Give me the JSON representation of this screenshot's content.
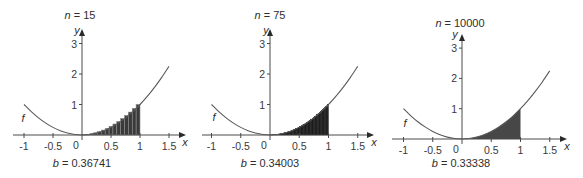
{
  "chart_data": [
    {
      "type": "line",
      "title": {
        "var": "n",
        "equals": "=",
        "value": "15"
      },
      "n": 15,
      "rule": "right endpoint rectangles",
      "shading": "rectangles",
      "shade_interval": [
        0,
        1
      ],
      "fill_color": "#3a3a3a",
      "edge_color": "#8c8c8c",
      "caption": {
        "var": "b",
        "equals": "=",
        "value": "0.36741"
      },
      "xlabel": "x",
      "ylabel": "y",
      "curve_label": "f",
      "xlim": [
        -1,
        1.5
      ],
      "ylim": [
        0,
        3
      ],
      "grid": false,
      "xticks": [
        -1,
        -0.5,
        0.5,
        1,
        1.5
      ],
      "xtick_labels": [
        "-1",
        "-0.5",
        "0.5",
        "1",
        "1.5"
      ],
      "origin_label": "0",
      "yticks": [
        1,
        2,
        3
      ],
      "ytick_labels": [
        "1",
        "2",
        "3"
      ],
      "rectangle_heights": [
        0.00444,
        0.01778,
        0.04,
        0.07111,
        0.11111,
        0.16,
        0.21778,
        0.28444,
        0.36,
        0.44444,
        0.53778,
        0.64,
        0.75111,
        0.87111,
        1.0
      ],
      "series": [
        {
          "name": "f",
          "x": [
            -1,
            -0.875,
            -0.75,
            -0.625,
            -0.5,
            -0.375,
            -0.25,
            -0.125,
            0,
            0.125,
            0.25,
            0.375,
            0.5,
            0.625,
            0.75,
            0.875,
            1,
            1.125,
            1.25,
            1.375,
            1.5
          ],
          "y": [
            1,
            0.765625,
            0.5625,
            0.390625,
            0.25,
            0.140625,
            0.0625,
            0.015625,
            0,
            0.015625,
            0.0625,
            0.140625,
            0.25,
            0.390625,
            0.5625,
            0.765625,
            1,
            1.265625,
            1.5625,
            1.890625,
            2.25
          ]
        }
      ]
    },
    {
      "type": "line",
      "title": {
        "var": "n",
        "equals": "=",
        "value": "75"
      },
      "n": 75,
      "rule": "right endpoint rectangles",
      "shading": "rectangles",
      "shade_interval": [
        0,
        1
      ],
      "fill_color": "#131313",
      "edge_color": "#131313",
      "caption": {
        "var": "b",
        "equals": "=",
        "value": "0.34003"
      },
      "xlabel": "x",
      "ylabel": "y",
      "curve_label": "f",
      "xlim": [
        -1,
        1.5
      ],
      "ylim": [
        0,
        3
      ],
      "grid": false,
      "xticks": [
        -1,
        -0.5,
        0.5,
        1,
        1.5
      ],
      "xtick_labels": [
        "-1",
        "-0.5",
        "0.5",
        "1",
        "1.5"
      ],
      "origin_label": "0",
      "yticks": [
        1,
        2,
        3
      ],
      "ytick_labels": [
        "1",
        "2",
        "3"
      ],
      "series": [
        {
          "name": "f",
          "x": [
            -1,
            -0.875,
            -0.75,
            -0.625,
            -0.5,
            -0.375,
            -0.25,
            -0.125,
            0,
            0.125,
            0.25,
            0.375,
            0.5,
            0.625,
            0.75,
            0.875,
            1,
            1.125,
            1.25,
            1.375,
            1.5
          ],
          "y": [
            1,
            0.765625,
            0.5625,
            0.390625,
            0.25,
            0.140625,
            0.0625,
            0.015625,
            0,
            0.015625,
            0.0625,
            0.140625,
            0.25,
            0.390625,
            0.5625,
            0.765625,
            1,
            1.265625,
            1.5625,
            1.890625,
            2.25
          ]
        }
      ]
    },
    {
      "type": "area",
      "title": {
        "var": "n",
        "equals": "=",
        "value": "10000"
      },
      "n": 10000,
      "rule": "right endpoint rectangles",
      "shading": "area",
      "shade_interval": [
        0,
        1
      ],
      "fill_color": "#474747",
      "edge_color": "#474747",
      "caption": {
        "var": "b",
        "equals": "=",
        "value": "0.33338"
      },
      "xlabel": "x",
      "ylabel": "y",
      "curve_label": "f",
      "xlim": [
        -1,
        1.5
      ],
      "ylim": [
        0,
        3
      ],
      "grid": false,
      "xticks": [
        -1,
        -0.5,
        0.5,
        1,
        1.5
      ],
      "xtick_labels": [
        "-1",
        "-0.5",
        "0.5",
        "1",
        "1.5"
      ],
      "origin_label": "0",
      "yticks": [
        1,
        2,
        3
      ],
      "ytick_labels": [
        "1",
        "2",
        "3"
      ],
      "series": [
        {
          "name": "f",
          "x": [
            -1,
            -0.875,
            -0.75,
            -0.625,
            -0.5,
            -0.375,
            -0.25,
            -0.125,
            0,
            0.125,
            0.25,
            0.375,
            0.5,
            0.625,
            0.75,
            0.875,
            1,
            1.125,
            1.25,
            1.375,
            1.5
          ],
          "y": [
            1,
            0.765625,
            0.5625,
            0.390625,
            0.25,
            0.140625,
            0.0625,
            0.015625,
            0,
            0.015625,
            0.0625,
            0.140625,
            0.25,
            0.390625,
            0.5625,
            0.765625,
            1,
            1.265625,
            1.5625,
            1.890625,
            2.25
          ]
        }
      ]
    }
  ]
}
